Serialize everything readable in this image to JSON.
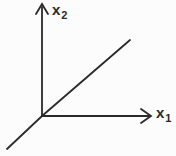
{
  "figure": {
    "type": "coordinate-axes-diagram",
    "colors": {
      "stroke": "#2a2a2a",
      "background": "#fcfcfc"
    },
    "y_axis": {
      "label_base": "x",
      "label_sub": "2"
    },
    "x_axis": {
      "label_base": "x",
      "label_sub": "1"
    },
    "diagonal_line": {
      "passes_through": "origin",
      "direction": "lower-left to upper-right",
      "approx_angle_deg": 43
    }
  }
}
